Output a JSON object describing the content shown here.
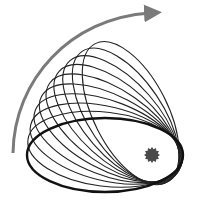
{
  "diagram": {
    "colors": {
      "background": "#ffffff",
      "orbit_bold": "#111111",
      "orbit_thin": "#222222",
      "arrow": "#7a7a7a",
      "star": "#4a4a4a"
    },
    "star": {
      "cx": 152,
      "cy": 155,
      "r_outer": 8,
      "r_inner": 6,
      "points": 12
    },
    "orbit": {
      "rx": 78,
      "ry": 37,
      "focus_offset": 47
    },
    "precession_angles_deg": [
      0,
      7,
      14,
      21,
      28,
      35,
      42,
      49,
      56,
      63
    ],
    "arrow": {
      "direction": "counterclockwise",
      "label": "precession direction"
    }
  }
}
